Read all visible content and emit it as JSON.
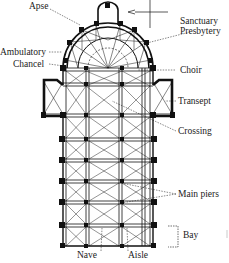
{
  "labels": {
    "apse": "Apse",
    "sanctuary": "Sanctuary",
    "presbytery": "Presbytery",
    "ambulatory": "Ambulatory",
    "chancel": "Chancel",
    "choir": "Choir",
    "transept": "Transept",
    "crossing": "Crossing",
    "main_piers": "Main piers",
    "bay": "Bay",
    "nave": "Nave",
    "aisle": "Aisle"
  },
  "colors": {
    "ink": "#111111",
    "text": "#222222",
    "background": "#ffffff"
  }
}
